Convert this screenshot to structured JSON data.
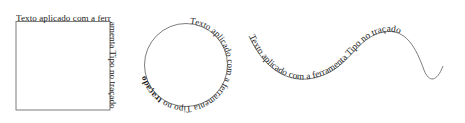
{
  "canvas": {
    "width": 465,
    "height": 123,
    "background": "#ffffff",
    "stroke_color": "#6e6e6e",
    "text_color": "#1b1b1b"
  },
  "shapes": {
    "square": {
      "label": "square-path-text",
      "shape_name": "rectangle",
      "text": "Texto aplicado com a ferramenta Tipo no traçado",
      "segments": {
        "top": "Texto aplicado com",
        "right": "a ferramenta Tip",
        "bottom": "o no traçado"
      }
    },
    "circle": {
      "label": "circle-path-text",
      "shape_name": "ellipse",
      "text_normal": "Texto aplicado com a ferramenta Tipo no ",
      "text_bold": "traçado",
      "text_full": "Texto aplicado com a ferramenta Tipo no traçado"
    },
    "wave": {
      "label": "wave-path-text",
      "shape_name": "s-curve",
      "text": "Texto aplicado com a ferramenta Tipo no traçado"
    }
  }
}
